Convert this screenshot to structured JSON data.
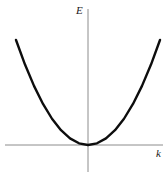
{
  "figure": {
    "background_color": "#ffffff",
    "width": 168,
    "height": 179,
    "vertical_axis_label": "E",
    "horizontal_axis_label": "k"
  },
  "chart_data": {
    "type": "line",
    "title": "",
    "xlabel": "k",
    "ylabel": "E",
    "grid": false,
    "legend": null,
    "axis_style": {
      "color": "#8c8c8c",
      "width": 1,
      "x_axis_pixel_y": 145,
      "y_axis_pixel_x": 88,
      "x_axis_extent_px": [
        5,
        163
      ],
      "y_axis_extent_px": [
        9,
        172
      ]
    },
    "series": [
      {
        "name": "E = A k^2",
        "color": "#0d0d0d",
        "line_width": 2.4,
        "relation": "E is proportional to k squared",
        "vertex": {
          "k": 0,
          "E": 0
        },
        "x": [
          -1.0,
          -0.875,
          -0.75,
          -0.625,
          -0.5,
          -0.375,
          -0.25,
          -0.125,
          0.0,
          0.125,
          0.25,
          0.375,
          0.5,
          0.625,
          0.75,
          0.875,
          1.0
        ],
        "values": [
          1.0,
          0.766,
          0.563,
          0.391,
          0.25,
          0.141,
          0.063,
          0.016,
          0.0,
          0.016,
          0.063,
          0.141,
          0.25,
          0.391,
          0.563,
          0.766,
          1.0
        ]
      }
    ],
    "xlim": [
      -1.0,
      1.0
    ],
    "ylim": [
      0.0,
      1.0
    ]
  }
}
